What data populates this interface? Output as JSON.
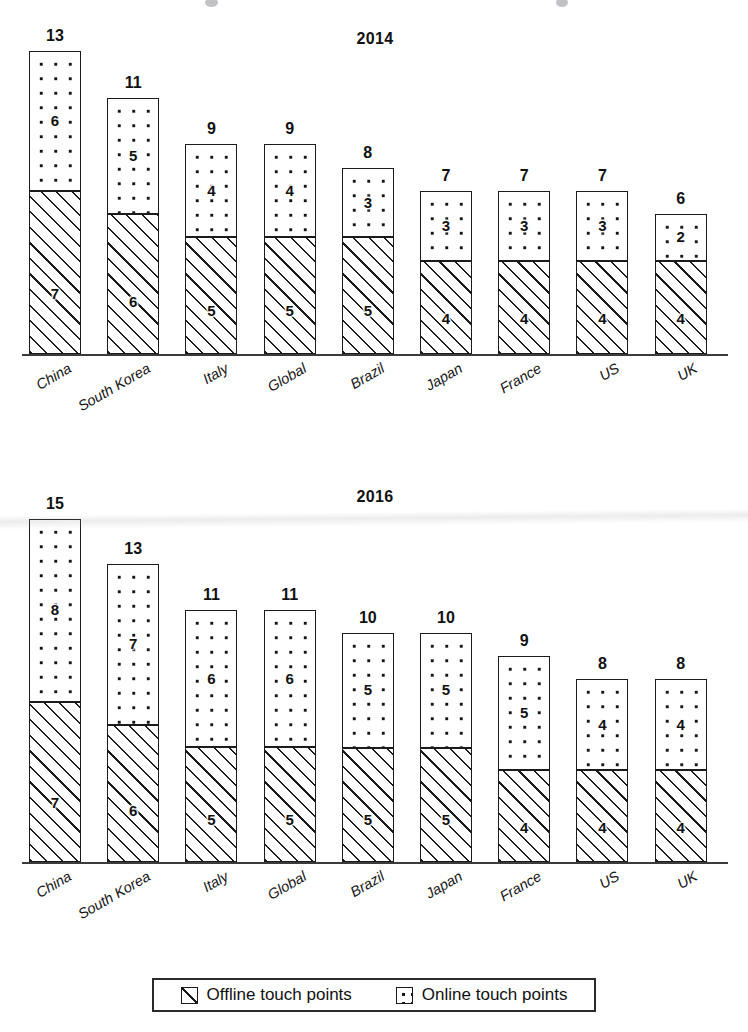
{
  "legend": {
    "items": [
      {
        "label": "Offline touch points",
        "pattern": "hatch",
        "icon": "hatch-square-icon"
      },
      {
        "label": "Online touch points",
        "pattern": "dots",
        "icon": "dot-square-icon"
      }
    ]
  },
  "colors": {
    "ink": "#1b1b1b",
    "background": "#ffffff",
    "axis": "#3b3b3b"
  },
  "chart_data": [
    {
      "type": "bar",
      "subtype": "stacked",
      "title": "2014",
      "xlabel": "",
      "ylabel": "",
      "ylim": [
        0,
        15
      ],
      "grid": false,
      "legend_position": "bottom",
      "categories": [
        "China",
        "South Korea",
        "Italy",
        "Global",
        "Brazil",
        "Japan",
        "France",
        "US",
        "UK"
      ],
      "series": [
        {
          "name": "Offline touch points",
          "values": [
            7,
            6,
            5,
            5,
            5,
            4,
            4,
            4,
            4
          ]
        },
        {
          "name": "Online touch points",
          "values": [
            6,
            5,
            4,
            4,
            3,
            3,
            3,
            3,
            2
          ]
        }
      ],
      "totals": [
        13,
        11,
        9,
        9,
        8,
        7,
        7,
        7,
        6
      ]
    },
    {
      "type": "bar",
      "subtype": "stacked",
      "title": "2016",
      "xlabel": "",
      "ylabel": "",
      "ylim": [
        0,
        15
      ],
      "grid": false,
      "legend_position": "bottom",
      "categories": [
        "China",
        "South Korea",
        "Italy",
        "Global",
        "Brazil",
        "Japan",
        "France",
        "US",
        "UK"
      ],
      "series": [
        {
          "name": "Offline touch points",
          "values": [
            7,
            6,
            5,
            5,
            5,
            5,
            4,
            4,
            4
          ]
        },
        {
          "name": "Online touch points",
          "values": [
            8,
            7,
            6,
            6,
            5,
            5,
            5,
            4,
            4
          ]
        }
      ],
      "totals": [
        15,
        13,
        11,
        11,
        10,
        10,
        9,
        8,
        8
      ]
    }
  ]
}
